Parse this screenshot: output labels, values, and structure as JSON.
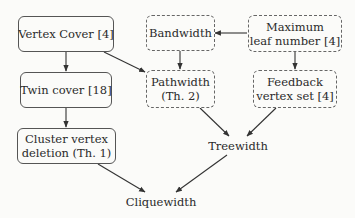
{
  "diagram": {
    "type": "parameter hierarchy",
    "nodes": [
      {
        "id": "vertex_cover",
        "lines": [
          "Vertex Cover [4]"
        ],
        "style": "solid"
      },
      {
        "id": "bandwidth",
        "lines": [
          "Bandwidth"
        ],
        "style": "dashed"
      },
      {
        "id": "max_leaf",
        "lines": [
          "Maximum",
          "leaf number [4]"
        ],
        "style": "dashed"
      },
      {
        "id": "twin_cover",
        "lines": [
          "Twin cover [18]"
        ],
        "style": "solid"
      },
      {
        "id": "pathwidth",
        "lines": [
          "Pathwidth",
          "(Th. 2)"
        ],
        "style": "dashed"
      },
      {
        "id": "feedback_vs",
        "lines": [
          "Feedback",
          "vertex set [4]"
        ],
        "style": "dashed"
      },
      {
        "id": "cluster_vd",
        "lines": [
          "Cluster vertex",
          "deletion (Th. 1)"
        ],
        "style": "solid"
      },
      {
        "id": "treewidth",
        "lines": [
          "Treewidth"
        ],
        "style": "none"
      },
      {
        "id": "cliquewidth",
        "lines": [
          "Cliquewidth"
        ],
        "style": "none"
      }
    ],
    "edges": [
      {
        "from": "vertex_cover",
        "to": "twin_cover"
      },
      {
        "from": "vertex_cover",
        "to": "pathwidth"
      },
      {
        "from": "max_leaf",
        "to": "bandwidth"
      },
      {
        "from": "bandwidth",
        "to": "pathwidth"
      },
      {
        "from": "max_leaf",
        "to": "feedback_vs"
      },
      {
        "from": "twin_cover",
        "to": "cluster_vd"
      },
      {
        "from": "pathwidth",
        "to": "treewidth"
      },
      {
        "from": "feedback_vs",
        "to": "treewidth"
      },
      {
        "from": "cluster_vd",
        "to": "cliquewidth"
      },
      {
        "from": "treewidth",
        "to": "cliquewidth"
      }
    ],
    "colors": {
      "line": "#333333",
      "background": "#fbfbf9",
      "text": "#2a2a2a"
    }
  }
}
